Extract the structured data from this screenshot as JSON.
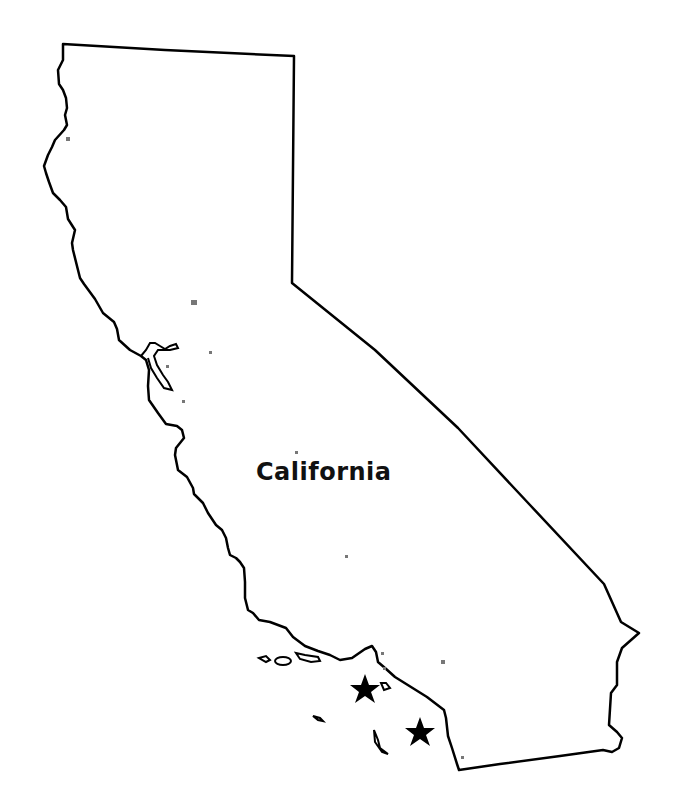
{
  "map": {
    "state_label": "California",
    "outline_color": "#000000",
    "fill_color": "#ffffff",
    "marker_color": "#000000",
    "dot_color": "#777777",
    "markers": [
      {
        "name": "star-marker-north",
        "shape": "star",
        "x": 365,
        "y": 689
      },
      {
        "name": "star-marker-south",
        "shape": "star",
        "x": 420,
        "y": 733
      }
    ]
  }
}
